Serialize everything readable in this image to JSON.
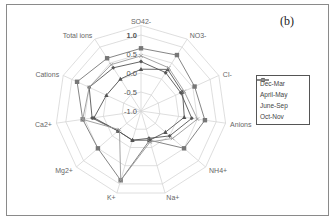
{
  "panel_label": "(b)",
  "chart_data": {
    "type": "radar",
    "title": "",
    "axes": [
      "SO42-",
      "NO3-",
      "Cl-",
      "Anions",
      "NH4+",
      "Na+",
      "K+",
      "Mg2+",
      "Ca2+",
      "Cations",
      "Total ions"
    ],
    "radial_ticks": [
      "1.0",
      "0.5",
      "0.0",
      "-0.5",
      "-1.0"
    ],
    "rlim": [
      -1.0,
      1.0
    ],
    "grid": true,
    "legend_position": "right",
    "series": [
      {
        "name": "Dec-Mar",
        "marker": "diamond",
        "color": "#555555",
        "values": [
          0.3,
          0.2,
          0.15,
          0.35,
          0.0,
          -0.25,
          -0.2,
          -0.2,
          0.3,
          0.5,
          0.35
        ]
      },
      {
        "name": "April-May",
        "marker": "square",
        "color": "#777777",
        "values": [
          0.65,
          0.75,
          0.55,
          0.7,
          0.5,
          -0.2,
          0.9,
          0.5,
          0.55,
          0.85,
          0.65
        ]
      },
      {
        "name": "June-Sep",
        "marker": "triangle",
        "color": "#555555",
        "values": [
          0.1,
          0.3,
          0.2,
          0.15,
          -0.15,
          -0.2,
          -0.2,
          -0.2,
          0.25,
          0.0,
          0.0
        ]
      },
      {
        "name": "Oct-Nov",
        "marker": "cross",
        "color": "#999999",
        "values": [
          0.45,
          0.35,
          0.25,
          0.5,
          0.1,
          -0.15,
          0.9,
          -0.25,
          0.55,
          0.5,
          0.45
        ]
      }
    ]
  }
}
